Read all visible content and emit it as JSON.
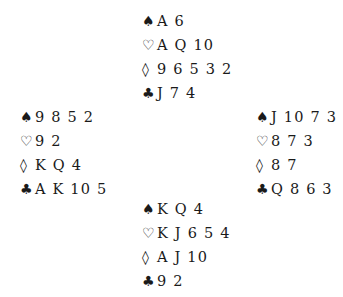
{
  "deal": {
    "north": {
      "spades": "A 6",
      "hearts": "A Q 10",
      "diamonds": "9 6 5 3 2",
      "clubs": "J 7 4"
    },
    "west": {
      "spades": "9 8 5 2",
      "hearts": "9 2",
      "diamonds": "K Q 4",
      "clubs": "A K 10 5"
    },
    "east": {
      "spades": "J 10 7 3",
      "hearts": "8 7 3",
      "diamonds": "8 7",
      "clubs": "Q 8 6 3"
    },
    "south": {
      "spades": "K Q 4",
      "hearts": "K J 6 5 4",
      "diamonds": "A J 10",
      "clubs": "9 2"
    }
  },
  "symbols": {
    "spades": "♠",
    "hearts": "♡",
    "diamonds": "◊",
    "clubs": "♣"
  }
}
